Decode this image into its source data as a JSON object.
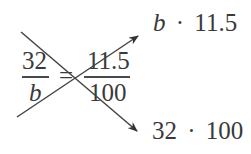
{
  "equation": {
    "left": {
      "numerator": "32",
      "denominator": "b"
    },
    "equals": "=",
    "right": {
      "numerator": "11.5",
      "denominator": "100"
    }
  },
  "products": {
    "top": {
      "var": "b",
      "dot": "·",
      "value": "11.5"
    },
    "bottom": {
      "a": "32",
      "dot": "·",
      "b": "100"
    }
  },
  "colors": {
    "text": "#3a3a3a",
    "arrow": "#333333",
    "background": "#ffffff"
  }
}
